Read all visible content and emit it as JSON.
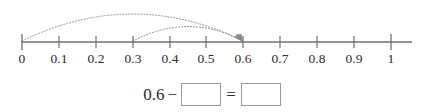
{
  "figure": {
    "type": "number-line-subtraction",
    "number_line": {
      "min": 0,
      "max": 1,
      "tick_step": 0.1,
      "tick_labels": [
        "0",
        "0.1",
        "0.2",
        "0.3",
        "0.4",
        "0.5",
        "0.6",
        "0.7",
        "0.8",
        "0.9",
        "1"
      ],
      "tick_values": [
        0,
        0.1,
        0.2,
        0.3,
        0.4,
        0.5,
        0.6,
        0.7,
        0.8,
        0.9,
        1
      ],
      "axis_color": "#6e6e6e",
      "label_color": "#2b2b2b"
    },
    "arcs": [
      {
        "name": "outer-arc",
        "from": 0,
        "to": 0.6,
        "style": "dotted",
        "arrowhead": "end",
        "color": "#8a8a8a"
      },
      {
        "name": "inner-arc",
        "from": 0.3,
        "to": 0.6,
        "style": "dotted",
        "arrowhead": "end",
        "color": "#8a8a8a"
      }
    ]
  },
  "equation": {
    "minuend": "0.6",
    "minus_sign": "−",
    "subtrahend_value": "",
    "equals_sign": "=",
    "difference_value": "",
    "box_border_color": "#9a9a9a"
  }
}
